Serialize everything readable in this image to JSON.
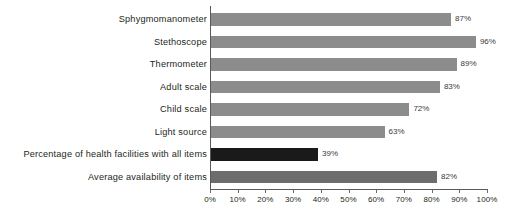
{
  "chart_data": {
    "type": "bar",
    "orientation": "horizontal",
    "title": "",
    "subtitle": "",
    "xlabel": "",
    "ylabel": "",
    "xlim": [
      0,
      100
    ],
    "grid": false,
    "legend": null,
    "x_ticks": [
      "0%",
      "10%",
      "20%",
      "30%",
      "40%",
      "50%",
      "60%",
      "70%",
      "80%",
      "90%",
      "100%"
    ],
    "x_tick_values": [
      0,
      10,
      20,
      30,
      40,
      50,
      60,
      70,
      80,
      90,
      100
    ],
    "categories": [
      "Sphygmomanometer",
      "Stethoscope",
      "Thermometer",
      "Adult scale",
      "Child scale",
      "Light source",
      "Percentage of health facilities with all items",
      "Average availability of items"
    ],
    "values": [
      87,
      96,
      89,
      83,
      72,
      63,
      39,
      82
    ],
    "data_labels": [
      "87%",
      "96%",
      "89%",
      "83%",
      "72%",
      "63%",
      "39%",
      "82%"
    ],
    "bar_colors": [
      "#8c8c8c",
      "#8c8c8c",
      "#8c8c8c",
      "#8c8c8c",
      "#8c8c8c",
      "#8c8c8c",
      "#1a1a1a",
      "#6d6d6d"
    ],
    "bar_styles": [
      "item",
      "item",
      "item",
      "item",
      "item",
      "item",
      "dark",
      "summary"
    ]
  },
  "colors": {
    "background": "#ffffff",
    "item_bar": "#8c8c8c",
    "all_items_bar": "#1a1a1a",
    "average_bar": "#6d6d6d",
    "axis": "#5a5a5a",
    "text": "#231f20",
    "value_text": "#3a3a3a"
  }
}
